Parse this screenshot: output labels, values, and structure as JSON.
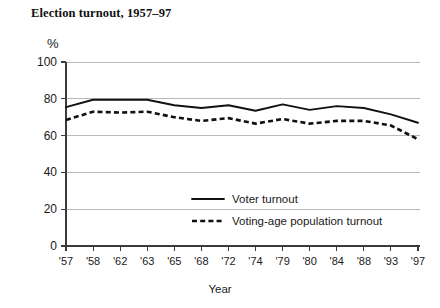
{
  "chart_data": {
    "type": "line",
    "title": "Election turnout, 1957–97",
    "xlabel": "Year",
    "ylabel": "%",
    "ylim": [
      0,
      100
    ],
    "yticks": [
      0,
      20,
      40,
      60,
      80,
      100
    ],
    "grid": true,
    "legend_position": "inside-center-bottom",
    "categories": [
      "'57",
      "'58",
      "'62",
      "'63",
      "'65",
      "'68",
      "'72",
      "'74",
      "'79",
      "'80",
      "'84",
      "'88",
      "'93",
      "'97"
    ],
    "series": [
      {
        "name": "Voter turnout",
        "style": "solid",
        "values": [
          75.5,
          79.5,
          79.5,
          79.5,
          76.5,
          75.0,
          76.5,
          73.5,
          77.0,
          74.0,
          76.0,
          75.0,
          71.5,
          67.0
        ]
      },
      {
        "name": "Voting-age population turnout",
        "style": "dashed",
        "values": [
          68.5,
          73.0,
          72.5,
          73.0,
          70.0,
          68.0,
          69.5,
          66.5,
          69.0,
          66.5,
          68.0,
          68.0,
          65.5,
          58.0
        ]
      }
    ]
  },
  "legend": {
    "items": [
      {
        "label": "Voter turnout",
        "style": "solid"
      },
      {
        "label": "Voting-age population turnout",
        "style": "dashed"
      }
    ]
  },
  "axis": {
    "y_unit": "%",
    "x_title": "Year"
  }
}
